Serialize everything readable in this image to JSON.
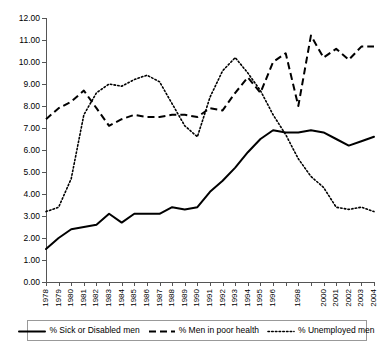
{
  "chart_data": {
    "type": "line",
    "title": "",
    "subtitle": "",
    "xlabel": "",
    "ylabel": "",
    "ylim": [
      0,
      12
    ],
    "ytick_labels": [
      "12.00",
      "11.00",
      "10.00",
      "9.00",
      "8.00",
      "7.00",
      "6.00",
      "5.00",
      "4.00",
      "3.00",
      "2.00",
      "1.00",
      "0.00"
    ],
    "ytick_values": [
      12,
      11,
      10,
      9,
      8,
      7,
      6,
      5,
      4,
      3,
      2,
      1,
      0
    ],
    "grid": false,
    "legend_position": "bottom",
    "x": [
      1978,
      1979,
      1980,
      1981,
      1982,
      1983,
      1984,
      1985,
      1986,
      1987,
      1988,
      1989,
      1990,
      1991,
      1992,
      1993,
      1994,
      1995,
      1996,
      1997,
      1998,
      1999,
      2000,
      2001,
      2002,
      2003,
      2004
    ],
    "xtick_labels": [
      "1978",
      "1979",
      "1980",
      "1981",
      "1982",
      "1983",
      "1984",
      "1985",
      "1986",
      "1987",
      "1988",
      "1989",
      "1990",
      "1991",
      "1992",
      "1993",
      "1994",
      "1995",
      "1996",
      "",
      "1998",
      "",
      "2000",
      "2001",
      "2002",
      "2003",
      "2004"
    ],
    "series": [
      {
        "name": "% Sick or Disabled men",
        "style": "solid",
        "color": "#000000",
        "values": [
          1.5,
          2.0,
          2.4,
          2.5,
          2.6,
          3.1,
          2.7,
          3.1,
          3.1,
          3.1,
          3.4,
          3.3,
          3.4,
          4.1,
          4.6,
          5.2,
          5.9,
          6.5,
          6.9,
          6.8,
          6.8,
          6.9,
          6.8,
          6.5,
          6.2,
          6.4,
          6.6
        ]
      },
      {
        "name": "% Men in poor health",
        "style": "dashed",
        "color": "#000000",
        "values": [
          7.4,
          7.9,
          8.2,
          8.7,
          7.9,
          7.1,
          7.4,
          7.6,
          7.5,
          7.5,
          7.6,
          7.6,
          7.5,
          7.9,
          7.8,
          8.6,
          9.3,
          8.6,
          10.0,
          10.4,
          8.0,
          11.2,
          10.2,
          10.6,
          10.1,
          10.7,
          10.7
        ]
      },
      {
        "name": "% Unemployed men",
        "style": "dotted",
        "color": "#000000",
        "values": [
          3.2,
          3.4,
          4.7,
          7.6,
          8.6,
          9.0,
          8.9,
          9.2,
          9.4,
          9.1,
          8.1,
          7.1,
          6.6,
          8.4,
          9.6,
          10.2,
          9.5,
          8.7,
          7.6,
          6.7,
          5.6,
          4.8,
          4.3,
          3.4,
          3.3,
          3.4,
          3.2
        ]
      }
    ]
  },
  "legend": {
    "items": [
      {
        "label": "% Sick or Disabled men",
        "style": "solid"
      },
      {
        "label": "% Men in poor health",
        "style": "dashed"
      },
      {
        "label": "% Unemployed men",
        "style": "dotted"
      }
    ]
  }
}
